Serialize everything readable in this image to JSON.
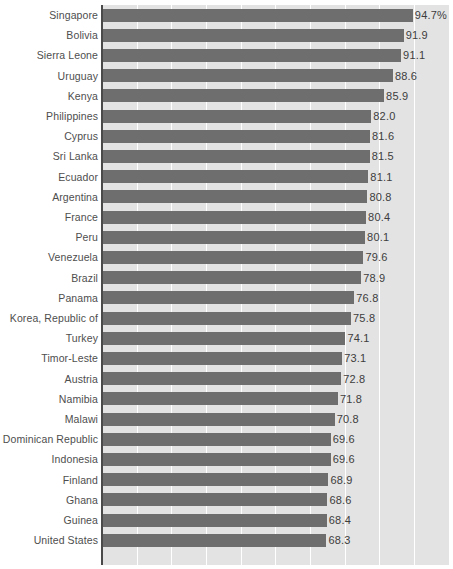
{
  "chart_data": {
    "type": "bar",
    "orientation": "horizontal",
    "title": "",
    "subtitle": "",
    "xlabel": "",
    "ylabel": "",
    "xlim": [
      0,
      106.4
    ],
    "grid": "vertical",
    "legend": "none",
    "value_suffix_first": "%",
    "categories": [
      "Singapore",
      "Bolivia",
      "Sierra Leone",
      "Uruguay",
      "Kenya",
      "Philippines",
      "Cyprus",
      "Sri Lanka",
      "Ecuador",
      "Argentina",
      "France",
      "Peru",
      "Venezuela",
      "Brazil",
      "Panama",
      "Korea, Republic of",
      "Turkey",
      "Timor-Leste",
      "Austria",
      "Namibia",
      "Malawi",
      "Dominican Republic",
      "Indonesia",
      "Finland",
      "Ghana",
      "Guinea",
      "United States"
    ],
    "values": [
      94.7,
      91.9,
      91.1,
      88.6,
      85.9,
      82.0,
      81.6,
      81.5,
      81.1,
      80.8,
      80.4,
      80.1,
      79.6,
      78.9,
      76.8,
      75.8,
      74.1,
      73.1,
      72.8,
      71.8,
      70.8,
      69.6,
      69.6,
      68.9,
      68.6,
      68.4,
      68.3
    ],
    "value_labels": [
      "94.7%",
      "91.9",
      "91.1",
      "88.6",
      "85.9",
      "82.0",
      "81.6",
      "81.5",
      "81.1",
      "80.8",
      "80.4",
      "80.1",
      "79.6",
      "78.9",
      "76.8",
      "75.8",
      "74.1",
      "73.1",
      "72.8",
      "71.8",
      "70.8",
      "69.6",
      "69.6",
      "68.9",
      "68.6",
      "68.4",
      "68.3"
    ],
    "gridline_values": [
      10.6,
      21.2,
      31.8,
      42.4,
      53.0,
      63.6,
      74.2,
      84.8,
      95.4,
      106.0
    ],
    "colors": {
      "bar": "#6e6e6e",
      "plot_background": "#e3e3e3",
      "gridline": "#ffffff",
      "axis": "#4a4a4a",
      "label_text": "#4e4e4e",
      "value_text": "#3d3d3d",
      "page_background": "#ffffff"
    }
  }
}
